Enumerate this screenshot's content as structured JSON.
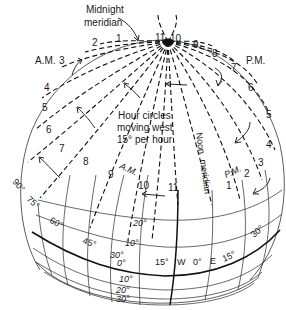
{
  "title_labels": {
    "midnight_meridian": [
      "Midnight",
      "meridian"
    ],
    "am": "A.M.",
    "pm": "P.M.",
    "hour_circles": [
      "Hour circles",
      "moving west",
      "15° per hour"
    ],
    "noon_meridian": [
      "Noon",
      "meridian"
    ],
    "am_inner": "A.M.",
    "pm_inner": "P.M."
  },
  "hour_labels_outer": {
    "am": [
      "1",
      "2",
      "3",
      "4",
      "5",
      "6",
      "7"
    ],
    "pm": [
      "11",
      "10",
      "9",
      "8",
      "7",
      "6",
      "5",
      "4"
    ]
  },
  "hour_labels_inner": {
    "am": [
      "8",
      "9",
      "10",
      "11"
    ],
    "pm": [
      "1",
      "2",
      "3"
    ]
  },
  "longitude_labels": {
    "west": [
      "90°",
      "75°",
      "60°",
      "45°",
      "15°"
    ],
    "center": "0°",
    "east": [
      "15°",
      "30°"
    ],
    "w": "W",
    "e": "E"
  },
  "latitude_labels": {
    "north": [
      "20°",
      "10°",
      "30°"
    ],
    "equator": "0°",
    "south": [
      "10°",
      "20°",
      "30°"
    ]
  },
  "colors": {
    "ink": "#111111",
    "background": "#ffffff"
  }
}
